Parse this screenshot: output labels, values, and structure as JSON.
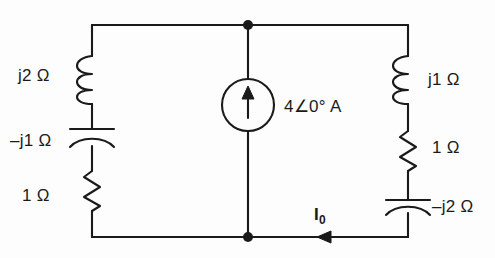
{
  "figure": {
    "type": "electrical-circuit-schematic",
    "background_color": "#fdfdfd",
    "line_color": "#1a1a1a"
  },
  "source": {
    "kind": "independent-current-source",
    "symbol": "circle-with-up-arrow",
    "direction": "up",
    "label": "4∠0° A"
  },
  "left_branch": {
    "components": [
      {
        "type": "inductor",
        "label": "j2 Ω"
      },
      {
        "type": "capacitor",
        "label": "–j1 Ω"
      },
      {
        "type": "resistor",
        "label": "1 Ω"
      }
    ]
  },
  "right_branch": {
    "components": [
      {
        "type": "inductor",
        "label": "j1 Ω"
      },
      {
        "type": "resistor",
        "label": "1 Ω"
      },
      {
        "type": "capacitor",
        "label": "–j2 Ω"
      }
    ]
  },
  "current_marker": {
    "name": "I0",
    "symbol": "I",
    "subscript": "0",
    "arrow_direction": "left",
    "location": "bottom-wire"
  },
  "nodes": [
    {
      "name": "top-node",
      "x": 248,
      "y": 25
    },
    {
      "name": "bottom-node",
      "x": 248,
      "y": 237
    }
  ]
}
